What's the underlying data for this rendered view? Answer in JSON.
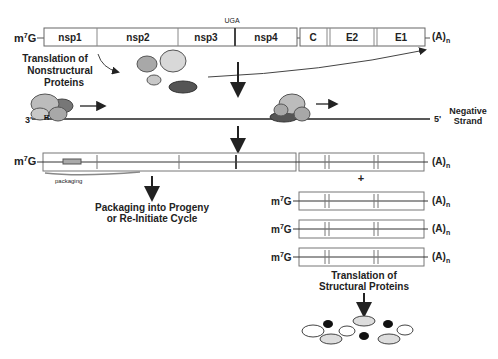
{
  "genome": {
    "cap": "m7G",
    "cap_sup": "7",
    "tail": "(A)n",
    "stop_codon": "UGA",
    "segments": [
      "nsp1",
      "nsp2",
      "nsp3",
      "nsp4",
      "C",
      "E2",
      "E1"
    ]
  },
  "labels": {
    "translation_nonstructural_1": "Translation of",
    "translation_nonstructural_2": "Nonstructural",
    "translation_nonstructural_3": "Proteins",
    "three_prime": "3'",
    "five_prime": "5'",
    "negative_1": "Negative",
    "negative_2": "Strand",
    "packaging": "packaging",
    "packaging_progeny_1": "Packaging into Progeny",
    "packaging_progeny_2": "or Re-Initiate Cycle",
    "plus": "+",
    "translation_structural_1": "Translation of",
    "translation_structural_2": "Structural Proteins"
  },
  "colors": {
    "outline": "#555555",
    "arrow": "#222222",
    "protein_light": "#d8d8d8",
    "protein_mid": "#b0b0b0",
    "protein_dark": "#555555",
    "protein_black": "#111111"
  }
}
